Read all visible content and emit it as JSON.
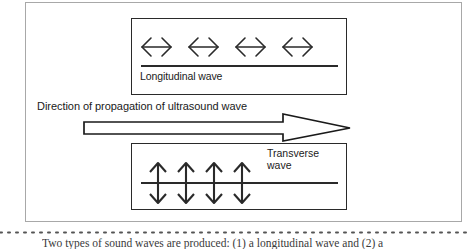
{
  "figure": {
    "type": "physics-diagram",
    "outer_frame": {
      "border_color": "#a8a8a8",
      "background": "#ffffff"
    },
    "stroke_color": "#2a2a2a"
  },
  "longitudinal": {
    "label": "Longitudinal wave",
    "arrow_count": 4,
    "arrow_icon": "left-right-double-arrow",
    "arrow_direction": "horizontal",
    "axis_line": true
  },
  "propagation": {
    "label": "Direction of propagation of ultrasound wave",
    "arrow_icon": "hollow-right-arrow",
    "arrow_direction": "right"
  },
  "transverse": {
    "label_line1": "Transverse",
    "label_line2": "wave",
    "arrow_count": 4,
    "arrow_icon": "up-down-double-arrow",
    "arrow_direction": "vertical",
    "axis_line": true
  },
  "caption": {
    "text": "Two types of sound waves are produced: (1) a longitudinal wave and (2) a"
  }
}
